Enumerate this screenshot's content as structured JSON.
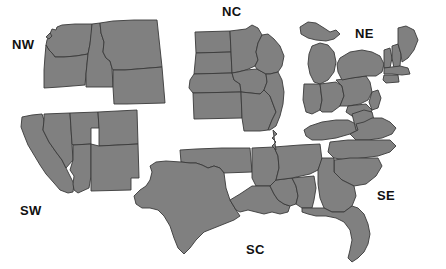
{
  "figure": {
    "name": "us-census-regions-map",
    "background_color": "#ffffff",
    "region_fill_color": "#808080",
    "region_outline_color": "#3a3a3a",
    "label_color": "#111111"
  },
  "regions": [
    {
      "code": "NW",
      "label": "NW",
      "name": "Northwest",
      "states": [
        "Washington",
        "Oregon",
        "Idaho",
        "Montana",
        "Wyoming"
      ],
      "label_position": {
        "x": 12,
        "y": 38
      }
    },
    {
      "code": "SW",
      "label": "SW",
      "name": "Southwest",
      "states": [
        "California",
        "Nevada",
        "Utah",
        "Arizona",
        "Colorado",
        "New Mexico"
      ],
      "label_position": {
        "x": 20,
        "y": 204
      }
    },
    {
      "code": "NC",
      "label": "NC",
      "name": "North Central",
      "states": [
        "North Dakota",
        "South Dakota",
        "Nebraska",
        "Kansas",
        "Minnesota",
        "Iowa",
        "Missouri",
        "Wisconsin",
        "Illinois"
      ],
      "label_position": {
        "x": 222,
        "y": 5
      }
    },
    {
      "code": "SC",
      "label": "SC",
      "name": "South Central",
      "states": [
        "Texas",
        "Oklahoma",
        "Arkansas",
        "Louisiana",
        "Mississippi",
        "Alabama",
        "Tennessee"
      ],
      "label_position": {
        "x": 246,
        "y": 243
      }
    },
    {
      "code": "NE",
      "label": "NE",
      "name": "Northeast",
      "states": [
        "Michigan",
        "Indiana",
        "Ohio",
        "Pennsylvania",
        "New York",
        "Vermont",
        "New Hampshire",
        "Maine",
        "Massachusetts",
        "Rhode Island",
        "Connecticut",
        "New Jersey",
        "Delaware",
        "Maryland"
      ],
      "label_position": {
        "x": 355,
        "y": 27
      }
    },
    {
      "code": "SE",
      "label": "SE",
      "name": "Southeast",
      "states": [
        "Kentucky",
        "West Virginia",
        "Virginia",
        "North Carolina",
        "South Carolina",
        "Georgia",
        "Florida"
      ],
      "label_position": {
        "x": 377,
        "y": 189
      }
    }
  ]
}
